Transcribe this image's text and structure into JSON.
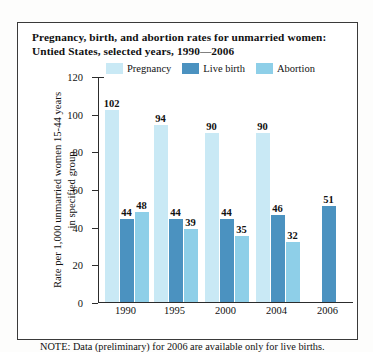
{
  "figure": {
    "title_line1": "Pregnancy, birth, and abortion rates for unmarried women:",
    "title_line2": "Untied States, selected years, 1990—2006",
    "note": "NOTE: Data (preliminary) for 2006 are available only for live births.",
    "ylabel_line1": "Rate per 1,000 unmarried women 15-44 years",
    "ylabel_line2": "in specified group"
  },
  "colors": {
    "pregnancy": "#c9e9f5",
    "live_birth": "#4b92c0",
    "abortion": "#8ecfe8",
    "axis": "#2c2c2c",
    "border": "#3a3a3a",
    "text": "#111111"
  },
  "chart_data": {
    "type": "bar",
    "title": "Pregnancy, birth, and abortion rates for unmarried women: Untied States, selected years, 1990—2006",
    "xlabel": "",
    "ylabel": "Rate per 1,000 unmarried women 15-44 years in specified group",
    "categories": [
      "1990",
      "1995",
      "2000",
      "2004",
      "2006"
    ],
    "ylim": [
      0,
      120
    ],
    "yticks": [
      0,
      20,
      40,
      60,
      80,
      100,
      120
    ],
    "ytick_labels": [
      "0",
      "20",
      "40",
      "60",
      "80",
      "100",
      "120"
    ],
    "grid": false,
    "legend_position": "top",
    "series": [
      {
        "name": "Pregnancy",
        "color": "#c9e9f5",
        "values": [
          102,
          94,
          90,
          90,
          null
        ],
        "labels": [
          "102",
          "94",
          "90",
          "90",
          ""
        ]
      },
      {
        "name": "Live birth",
        "color": "#4b92c0",
        "values": [
          44,
          44,
          44,
          46,
          51
        ],
        "labels": [
          "44",
          "44",
          "44",
          "46",
          "51"
        ]
      },
      {
        "name": "Abortion",
        "color": "#8ecfe8",
        "values": [
          48,
          39,
          35,
          32,
          null
        ],
        "labels": [
          "48",
          "39",
          "35",
          "32",
          ""
        ]
      }
    ],
    "annotations": [
      "NOTE: Data (preliminary) for 2006 are available only for live births."
    ]
  }
}
